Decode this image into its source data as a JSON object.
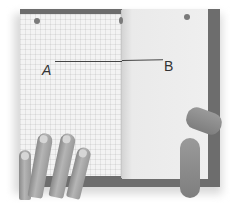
{
  "photo": {
    "subject": "graph paper booklet held open by hands with a line segment drawn from A to B across the fold",
    "points": [
      {
        "label": "A"
      },
      {
        "label": "B"
      }
    ],
    "colors": {
      "paper": "#f3f3f3",
      "backing": "#6d6d6d",
      "ink": "#444444",
      "skin": "#9a9a9a"
    }
  }
}
